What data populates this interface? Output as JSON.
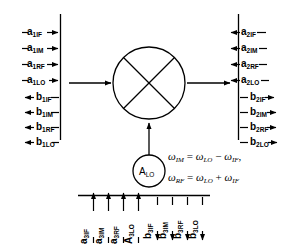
{
  "diagram": {
    "mixer": {
      "symbol": "mixer-circle-x"
    },
    "lo_source": {
      "label_main": "A",
      "label_sub": "LO"
    },
    "ports": {
      "port1_incident": [
        {
          "main": "a",
          "sub": "1IF"
        },
        {
          "main": "a",
          "sub": "1IM"
        },
        {
          "main": "a",
          "sub": "1RF"
        },
        {
          "main": "a",
          "sub": "1LO"
        }
      ],
      "port1_reflected": [
        {
          "main": "b",
          "sub": "1IF"
        },
        {
          "main": "b",
          "sub": "1IM"
        },
        {
          "main": "b",
          "sub": "1RF"
        },
        {
          "main": "b",
          "sub": "1LO"
        }
      ],
      "port2_incident": [
        {
          "main": "a",
          "sub": "2IF"
        },
        {
          "main": "a",
          "sub": "2IM"
        },
        {
          "main": "a",
          "sub": "2RF"
        },
        {
          "main": "a",
          "sub": "2LO"
        }
      ],
      "port2_reflected": [
        {
          "main": "b",
          "sub": "2IF"
        },
        {
          "main": "b",
          "sub": "2IM"
        },
        {
          "main": "b",
          "sub": "2RF"
        },
        {
          "main": "b",
          "sub": "2LO"
        }
      ],
      "port3_incident": [
        {
          "main": "a",
          "sub": "3IF"
        },
        {
          "main": "a",
          "sub": "3IM"
        },
        {
          "main": "a",
          "sub": "3RF"
        },
        {
          "main": "A",
          "sub": "3LO"
        }
      ],
      "port3_reflected": [
        {
          "main": "b",
          "sub": "3IF"
        },
        {
          "main": "b",
          "sub": "3IM"
        },
        {
          "main": "b",
          "sub": "3RF"
        },
        {
          "main": "b",
          "sub": "3LO"
        }
      ]
    },
    "equations": [
      {
        "lhs_sym": "ω",
        "lhs_sub": "IM",
        "op1": "=",
        "t1_sym": "ω",
        "t1_sub": "LO",
        "op2": "−",
        "t2_sym": "ω",
        "t2_sub": "IF",
        "tail": ","
      },
      {
        "lhs_sym": "ω",
        "lhs_sub": "RF",
        "op1": "=",
        "t1_sym": "ω",
        "t1_sub": "LO",
        "op2": "+",
        "t2_sym": "ω",
        "t2_sub": "IF",
        "tail": ""
      }
    ],
    "colors": {
      "stroke": "#000000",
      "background": "#ffffff"
    }
  }
}
